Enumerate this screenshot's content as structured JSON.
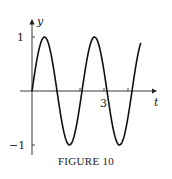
{
  "chart_data": {
    "type": "line",
    "title": "",
    "xlabel": "t",
    "ylabel": "y",
    "x_tick_labels": [
      "3"
    ],
    "y_tick_labels": [
      "1",
      "−1"
    ],
    "function": "y = sin(πt)",
    "series": [
      {
        "name": "y",
        "x": [
          0,
          0.5,
          1,
          1.5,
          2,
          2.5,
          3,
          3.5,
          4,
          4.4
        ],
        "values": [
          0,
          1,
          0,
          -1,
          0,
          1,
          0,
          -1,
          0,
          0.81
        ]
      }
    ],
    "xlim": [
      -0.4,
      5.3
    ],
    "ylim": [
      -1.2,
      1.2
    ],
    "grid": false,
    "legend": "none"
  },
  "axes": {
    "x_label": "t",
    "y_label": "y",
    "x_tick": "3",
    "y_tick_top": "1",
    "y_tick_bottom": "−1"
  },
  "caption": "FIGURE 10"
}
